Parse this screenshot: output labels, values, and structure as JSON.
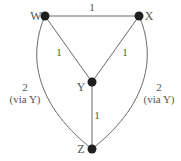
{
  "diagram": {
    "type": "weighted-graph",
    "colors": {
      "edge": "#6a6a6a",
      "node": "#1f1f1f",
      "text": "#555555"
    },
    "nodes": [
      {
        "id": "W",
        "label": "W",
        "x": 45,
        "y": 16
      },
      {
        "id": "X",
        "label": "X",
        "x": 139,
        "y": 16
      },
      {
        "id": "Y",
        "label": "Y",
        "x": 92,
        "y": 82
      },
      {
        "id": "Z",
        "label": "Z",
        "x": 92,
        "y": 149
      }
    ],
    "edges": [
      {
        "from": "W",
        "to": "X",
        "weight": "1"
      },
      {
        "from": "W",
        "to": "Y",
        "weight": "1"
      },
      {
        "from": "X",
        "to": "Y",
        "weight": "1"
      },
      {
        "from": "Y",
        "to": "Z",
        "weight": "1"
      },
      {
        "from": "W",
        "to": "Z",
        "weight": "2",
        "note": "(via Y)",
        "curved": true
      },
      {
        "from": "X",
        "to": "Z",
        "weight": "2",
        "note": "(via Y)",
        "curved": true
      }
    ]
  }
}
